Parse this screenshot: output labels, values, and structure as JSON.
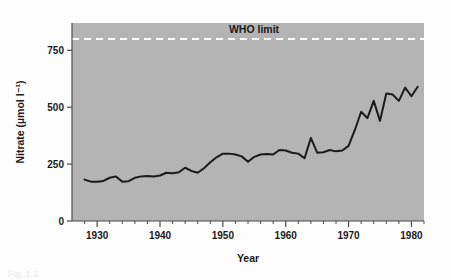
{
  "figure": {
    "background_color": "#fdfdfd",
    "plot_background_color": "#b4b4b4",
    "caption_fragment": "Fig. 1.1"
  },
  "chart_data": {
    "type": "line",
    "title": "",
    "xlabel": "Year",
    "ylabel": "Nitrate (µmol l⁻¹)",
    "xlim": [
      1926,
      1982
    ],
    "ylim": [
      0,
      870
    ],
    "grid": false,
    "legend_position": "none",
    "x_ticks_major": [
      1930,
      1940,
      1950,
      1960,
      1970,
      1980
    ],
    "x_tick_labels": [
      "1930",
      "1940",
      "1950",
      "1960",
      "1970",
      "1980"
    ],
    "x_tick_minor_step": 2,
    "y_ticks_major": [
      0,
      250,
      500,
      750
    ],
    "y_tick_labels": [
      "0",
      "250",
      "500",
      "750"
    ],
    "series": [
      {
        "name": "Nitrate concentration",
        "color": "#1a1a1a",
        "line_width": 2,
        "x": [
          1928,
          1929,
          1930,
          1931,
          1932,
          1933,
          1934,
          1935,
          1936,
          1937,
          1938,
          1939,
          1940,
          1941,
          1942,
          1943,
          1944,
          1945,
          1946,
          1947,
          1948,
          1949,
          1950,
          1951,
          1952,
          1953,
          1954,
          1955,
          1956,
          1957,
          1958,
          1959,
          1960,
          1961,
          1962,
          1963,
          1964,
          1965,
          1966,
          1967,
          1968,
          1969,
          1970,
          1971,
          1972,
          1973,
          1974,
          1975,
          1976,
          1977,
          1978,
          1979,
          1980,
          1981
        ],
        "values": [
          182,
          173,
          172,
          176,
          190,
          196,
          172,
          175,
          190,
          196,
          198,
          196,
          200,
          212,
          210,
          214,
          234,
          220,
          212,
          232,
          258,
          280,
          296,
          296,
          292,
          284,
          260,
          282,
          292,
          294,
          292,
          312,
          310,
          300,
          296,
          276,
          365,
          300,
          302,
          312,
          306,
          310,
          330,
          400,
          480,
          452,
          528,
          440,
          560,
          556,
          528,
          586,
          548,
          590
        ]
      }
    ],
    "annotations": [
      {
        "name": "who-limit",
        "label": "WHO limit",
        "value": 800,
        "style": "dashed",
        "color": "#ffffff",
        "label_color": "#1a1a1a"
      }
    ]
  }
}
